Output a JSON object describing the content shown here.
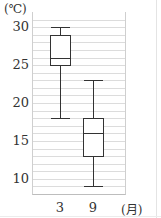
{
  "chart_data": {
    "type": "boxplot",
    "title": "",
    "xlabel": "(月)",
    "ylabel": "(℃)",
    "categories": [
      "3",
      "9"
    ],
    "series": [
      {
        "name": "3",
        "min": 18,
        "q1": 25,
        "median": 26,
        "q3": 29,
        "max": 30
      },
      {
        "name": "9",
        "min": 9,
        "q1": 13,
        "median": 16,
        "q3": 18,
        "max": 23
      }
    ],
    "yticks": [
      "10",
      "15",
      "20",
      "25",
      "30"
    ],
    "ylim": [
      8,
      32
    ],
    "grid": true,
    "grid_step": 1
  },
  "labels": {
    "y_unit": "(℃)",
    "x_unit": "(月)"
  }
}
